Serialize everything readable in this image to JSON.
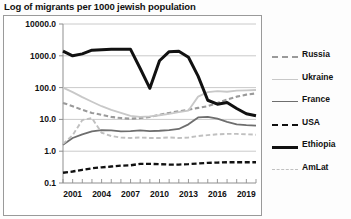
{
  "chart_data": {
    "type": "line",
    "title": "Log of migrants per 1000 jewish population",
    "xlabel": "",
    "ylabel": "",
    "yscale": "log",
    "ylim": [
      0.1,
      10000.0
    ],
    "ytick_labels": [
      "10000.0",
      "1000.0",
      "100.0",
      "10.0",
      "1.0",
      "0.1"
    ],
    "ytick_values": [
      10000.0,
      1000.0,
      100.0,
      10.0,
      1.0,
      0.1
    ],
    "xtick_labels": [
      "2001",
      "2004",
      "2007",
      "2010",
      "2013",
      "2016",
      "2019"
    ],
    "xtick_values": [
      2001,
      2004,
      2007,
      2010,
      2013,
      2016,
      2019
    ],
    "xlim": [
      2000,
      2020
    ],
    "grid": true,
    "legend_position": "right",
    "x": [
      2000,
      2001,
      2002,
      2003,
      2004,
      2005,
      2006,
      2007,
      2008,
      2009,
      2010,
      2011,
      2012,
      2013,
      2014,
      2015,
      2016,
      2017,
      2018,
      2019,
      2020
    ],
    "series": [
      {
        "name": "Russia",
        "color": "#9a9a9a",
        "style": "dashed",
        "width": 2.1,
        "values": [
          33,
          26,
          20,
          16,
          14,
          12,
          11,
          10.5,
          11,
          12,
          14,
          16,
          18,
          20,
          23,
          26,
          33,
          42,
          52,
          60,
          66
        ]
      },
      {
        "name": "Ukraine",
        "color": "#c8c8c8",
        "style": "solid",
        "width": 1.8,
        "values": [
          100,
          72,
          50,
          36,
          26,
          20,
          16,
          13,
          12,
          12.5,
          13.5,
          15,
          17,
          19,
          52,
          72,
          78,
          74,
          80,
          82,
          84
        ]
      },
      {
        "name": "France",
        "color": "#6e6e6e",
        "style": "solid",
        "width": 1.8,
        "values": [
          1.6,
          2.6,
          3.4,
          4.2,
          4.6,
          4.5,
          4.2,
          4.3,
          4.5,
          4.3,
          4.4,
          4.6,
          5.0,
          7.0,
          11.5,
          12.0,
          10.5,
          8.4,
          7.0,
          6.6,
          6.4
        ]
      },
      {
        "name": "USA",
        "color": "#111111",
        "style": "dashed",
        "width": 2.3,
        "values": [
          0.21,
          0.23,
          0.26,
          0.29,
          0.31,
          0.33,
          0.35,
          0.36,
          0.4,
          0.4,
          0.39,
          0.38,
          0.38,
          0.39,
          0.41,
          0.43,
          0.44,
          0.45,
          0.45,
          0.45,
          0.45
        ]
      },
      {
        "name": "Ethiopia",
        "color": "#111111",
        "style": "solid",
        "width": 3.0,
        "values": [
          1400,
          1000,
          1150,
          1500,
          1550,
          1600,
          1600,
          1600,
          400,
          95,
          700,
          1350,
          1400,
          900,
          230,
          40,
          30,
          34,
          22,
          15,
          13
        ]
      },
      {
        "name": "AmLat",
        "color": "#c0c0c0",
        "style": "dashed",
        "width": 1.9,
        "values": [
          1.7,
          3.2,
          9.5,
          11.0,
          3.8,
          3.0,
          2.7,
          2.6,
          2.7,
          2.6,
          2.6,
          2.7,
          2.6,
          2.7,
          3.0,
          3.2,
          3.4,
          3.5,
          3.5,
          3.4,
          3.3
        ]
      }
    ]
  }
}
